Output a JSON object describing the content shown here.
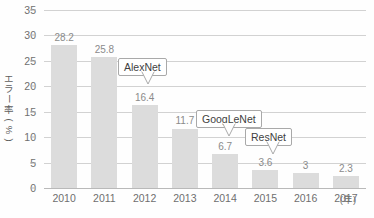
{
  "chart_data": {
    "type": "bar",
    "title": "",
    "subtitle": "",
    "xlabel": "(年)",
    "ylabel": "エラー率(%)",
    "categories": [
      "2010",
      "2011",
      "2012",
      "2013",
      "2014",
      "2015",
      "2016",
      "2017"
    ],
    "values": [
      28.2,
      25.8,
      16.4,
      11.7,
      6.7,
      3.6,
      3,
      2.3
    ],
    "value_labels": [
      "28.2",
      "25.8",
      "16.4",
      "11.7",
      "6.7",
      "3.6",
      "3",
      "2.3"
    ],
    "ylim": [
      0,
      35
    ],
    "yticks": [
      0,
      5,
      10,
      15,
      20,
      25,
      30,
      35
    ],
    "ytick_labels": [
      "0",
      "5",
      "10",
      "15",
      "20",
      "25",
      "30",
      "35"
    ],
    "grid": true,
    "legend": "none",
    "bar_color": "#dcdcdc",
    "grid_color": "#d2d2d2",
    "text_color": "#6f6f6f",
    "annotations": [
      {
        "label": "AlexNet",
        "points_to_category": "2012",
        "points_to_value": 16.4
      },
      {
        "label": "GoogLeNet",
        "points_to_category": "2014",
        "points_to_value": 6.7
      },
      {
        "label": "ResNet",
        "points_to_category": "2015",
        "points_to_value": 3.6
      }
    ]
  },
  "axis": {
    "y_title": "エラー率(%)",
    "y_title_chars": [
      "エ",
      "ラ",
      "ー",
      "率",
      "(%)"
    ],
    "x_unit": "(年)"
  }
}
